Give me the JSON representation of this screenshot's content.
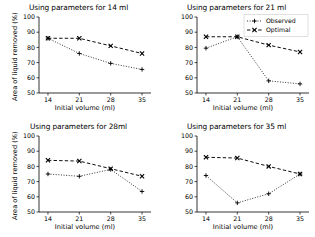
{
  "figure": {
    "axis_ylabel": "Area of liquid removed (%)",
    "axis_xlabel": "Initial volume (ml)",
    "ytick_labels": [
      "50",
      "60",
      "70",
      "80",
      "90",
      "100"
    ],
    "xtick_labels": [
      "14",
      "21",
      "28",
      "35"
    ],
    "legend": {
      "observed_label": "Observed",
      "optimal_label": "Optimal"
    },
    "colors": {
      "observed": "#000000",
      "optimal": "#000000",
      "axis": "#000000",
      "background": "#ffffff"
    }
  },
  "chart_data": [
    {
      "type": "line",
      "title": "Using parameters for 14 ml",
      "xlabel": "Initial volume (ml)",
      "ylabel": "Area of liquid removed (%)",
      "x": [
        14,
        21,
        28,
        35
      ],
      "xtick_labels": [
        "14",
        "21",
        "28",
        "35"
      ],
      "ylim": [
        50,
        100
      ],
      "yticks": [
        50,
        60,
        70,
        80,
        90,
        100
      ],
      "grid": false,
      "legend": "none",
      "series": [
        {
          "name": "Observed",
          "values": [
            86,
            76,
            69.5,
            65.5
          ],
          "linestyle": "dotted",
          "marker": "+"
        },
        {
          "name": "Optimal",
          "values": [
            86,
            86,
            81,
            76
          ],
          "linestyle": "dashed",
          "marker": "x"
        }
      ]
    },
    {
      "type": "line",
      "title": "Using parameters for 21 ml",
      "xlabel": "Initial volume (ml)",
      "ylabel": "Area of liquid removed (%)",
      "x": [
        14,
        21,
        28,
        35
      ],
      "xtick_labels": [
        "14",
        "21",
        "28",
        "35"
      ],
      "ylim": [
        50,
        100
      ],
      "yticks": [
        50,
        60,
        70,
        80,
        90,
        100
      ],
      "grid": false,
      "legend": "upper right",
      "series": [
        {
          "name": "Observed",
          "values": [
            79.5,
            87,
            58,
            56
          ],
          "linestyle": "dotted",
          "marker": "+"
        },
        {
          "name": "Optimal",
          "values": [
            87,
            87,
            81.5,
            77
          ],
          "linestyle": "dashed",
          "marker": "x"
        }
      ]
    },
    {
      "type": "line",
      "title": "Using parameters for 28ml",
      "xlabel": "Initial volume (ml)",
      "ylabel": "Area of liquid removed (%)",
      "x": [
        14,
        21,
        28,
        35
      ],
      "xtick_labels": [
        "14",
        "21",
        "28",
        "35"
      ],
      "ylim": [
        50,
        100
      ],
      "yticks": [
        50,
        60,
        70,
        80,
        90,
        100
      ],
      "grid": false,
      "legend": "none",
      "series": [
        {
          "name": "Observed",
          "values": [
            75,
            73.5,
            78,
            63.5
          ],
          "linestyle": "dotted",
          "marker": "+"
        },
        {
          "name": "Optimal",
          "values": [
            84,
            83.5,
            78.5,
            73.5
          ],
          "linestyle": "dashed",
          "marker": "x"
        }
      ]
    },
    {
      "type": "line",
      "title": "Using parameters for 35 ml",
      "xlabel": "Initial volume (ml)",
      "ylabel": "Area of liquid removed (%)",
      "x": [
        14,
        21,
        28,
        35
      ],
      "xtick_labels": [
        "14",
        "21",
        "28",
        "35"
      ],
      "ylim": [
        50,
        100
      ],
      "yticks": [
        50,
        60,
        70,
        80,
        90,
        100
      ],
      "grid": false,
      "legend": "none",
      "series": [
        {
          "name": "Observed",
          "values": [
            74,
            56,
            62,
            75
          ],
          "linestyle": "dotted",
          "marker": "+"
        },
        {
          "name": "Optimal",
          "values": [
            86,
            85.5,
            80,
            75
          ],
          "linestyle": "dashed",
          "marker": "x"
        }
      ]
    }
  ]
}
